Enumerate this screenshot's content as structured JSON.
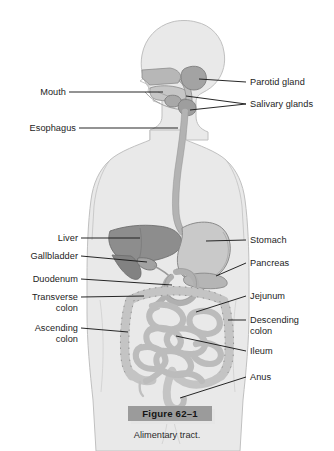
{
  "figure": {
    "title": "Alimentary tract",
    "number_label": "Figure 62–1",
    "caption": "Alimentary tract."
  },
  "colors": {
    "background": "#ffffff",
    "body_silhouette": "#e9e9e9",
    "body_outline": "#b9b9b9",
    "organ_light": "#cfcfcf",
    "organ_mid": "#bdbdbd",
    "organ_dark": "#8f8f8f",
    "organ_outline": "#8a8a8a",
    "leader_line": "#1b1b1b",
    "label_text": "#1c1c1c",
    "caption_box": "#9b9b9b"
  },
  "labels": {
    "left": [
      {
        "id": "mouth",
        "text": "Mouth"
      },
      {
        "id": "esophagus",
        "text": "Esophagus"
      },
      {
        "id": "liver",
        "text": "Liver"
      },
      {
        "id": "gallbladder",
        "text": "Gallbladder"
      },
      {
        "id": "duodenum",
        "text": "Duodenum"
      },
      {
        "id": "transverse-colon",
        "text": "Transverse\ncolon"
      },
      {
        "id": "ascending-colon",
        "text": "Ascending\ncolon"
      }
    ],
    "right": [
      {
        "id": "parotid-gland",
        "text": "Parotid gland"
      },
      {
        "id": "salivary-glands",
        "text": "Salivary glands"
      },
      {
        "id": "stomach",
        "text": "Stomach"
      },
      {
        "id": "pancreas",
        "text": "Pancreas"
      },
      {
        "id": "jejunum",
        "text": "Jejunum"
      },
      {
        "id": "descending-colon",
        "text": "Descending\ncolon"
      },
      {
        "id": "ileum",
        "text": "Ileum"
      },
      {
        "id": "anus",
        "text": "Anus"
      }
    ]
  }
}
